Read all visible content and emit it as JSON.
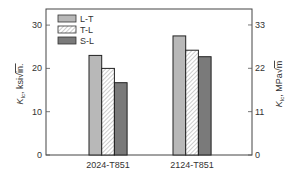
{
  "chart_data": {
    "type": "bar",
    "title": "",
    "categories": [
      "2024-T851",
      "2124-T851"
    ],
    "series": [
      {
        "name": "L-T",
        "values": [
          23,
          27.5
        ],
        "fill": "#b8b8b8",
        "pattern": "solid"
      },
      {
        "name": "T-L",
        "values": [
          20,
          24.2
        ],
        "fill": "#ffffff",
        "pattern": "hatch"
      },
      {
        "name": "S-L",
        "values": [
          16.7,
          22.7
        ],
        "fill": "#7a7a7a",
        "pattern": "solid"
      }
    ],
    "xlabel": "",
    "ylabel": "K_Ic, ksi√in.",
    "ylim": [
      0,
      34
    ],
    "yticks": [
      0,
      10,
      20,
      30
    ],
    "y2label": "K_Ic, MPa√m",
    "y2ticks": [
      0,
      11,
      22,
      33
    ],
    "grid": false,
    "legend_position": "upper-left-inside"
  },
  "labels": {
    "ylabel_main": "K",
    "ylabel_sub": "Ic",
    "ylabel_rest": ", ksi",
    "ylabel_unit": "in.",
    "y2label_main": "K",
    "y2label_sub": "Ic",
    "y2label_rest": ", MPa",
    "y2label_unit": "m"
  }
}
